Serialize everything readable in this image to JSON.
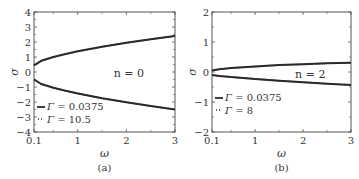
{
  "chart_data": [
    {
      "type": "line",
      "panel": "(a)",
      "caption": "(a)",
      "xlabel": "ω",
      "ylabel": "σ",
      "xlim": [
        0.1,
        3
      ],
      "ylim": [
        -4,
        4
      ],
      "xticks": [
        "0.1",
        "1",
        "2",
        "3"
      ],
      "yticks": [
        "-4",
        "-3",
        "-2",
        "-1",
        "0",
        "1",
        "2",
        "3",
        "4"
      ],
      "annotation": "n = 0",
      "x": [
        0.1,
        0.25,
        0.5,
        0.75,
        1.0,
        1.5,
        2.0,
        2.5,
        3.0
      ],
      "series": [
        {
          "name": "Γ = 0.0375",
          "style": "solid",
          "branch": "upper",
          "values": [
            0.45,
            0.75,
            1.0,
            1.2,
            1.38,
            1.68,
            1.95,
            2.18,
            2.4
          ]
        },
        {
          "name": "Γ = 0.0375",
          "style": "solid",
          "branch": "lower",
          "values": [
            -0.5,
            -0.8,
            -1.05,
            -1.25,
            -1.43,
            -1.75,
            -2.02,
            -2.27,
            -2.5
          ]
        },
        {
          "name": "Γ = 10.5",
          "style": "dotted",
          "branch": "upper",
          "values": [
            0.45,
            0.75,
            1.0,
            1.2,
            1.38,
            1.68,
            1.95,
            2.18,
            2.4
          ]
        },
        {
          "name": "Γ = 10.5",
          "style": "dotted",
          "branch": "lower",
          "values": [
            -0.5,
            -0.8,
            -1.05,
            -1.25,
            -1.43,
            -1.75,
            -2.02,
            -2.27,
            -2.5
          ]
        }
      ],
      "legend": [
        {
          "marker": "—",
          "label": "Γ = 0.0375"
        },
        {
          "marker": "··",
          "label": "Γ = 10.5"
        }
      ],
      "legend_position": "lower left"
    },
    {
      "type": "line",
      "panel": "(b)",
      "caption": "(b)",
      "xlabel": "ω",
      "ylabel": "σ",
      "xlim": [
        0.1,
        3
      ],
      "ylim": [
        -2,
        2
      ],
      "xticks": [
        "0.1",
        "1",
        "2",
        "3"
      ],
      "yticks": [
        "-2",
        "-1",
        "0",
        "1",
        "2"
      ],
      "annotation": "n = 2",
      "x": [
        0.1,
        0.25,
        0.5,
        0.75,
        1.0,
        1.5,
        2.0,
        2.5,
        3.0
      ],
      "series": [
        {
          "name": "Γ = 0.0375",
          "style": "solid",
          "branch": "upper",
          "values": [
            0.05,
            0.09,
            0.13,
            0.16,
            0.18,
            0.23,
            0.26,
            0.29,
            0.31
          ]
        },
        {
          "name": "Γ = 0.0375",
          "style": "solid",
          "branch": "lower",
          "values": [
            -0.1,
            -0.13,
            -0.17,
            -0.2,
            -0.23,
            -0.29,
            -0.34,
            -0.39,
            -0.43
          ]
        },
        {
          "name": "Γ = 8",
          "style": "dotted",
          "branch": "upper",
          "values": [
            0.05,
            0.09,
            0.13,
            0.16,
            0.18,
            0.23,
            0.26,
            0.29,
            0.31
          ]
        },
        {
          "name": "Γ = 8",
          "style": "dotted",
          "branch": "lower",
          "values": [
            -0.1,
            -0.13,
            -0.17,
            -0.2,
            -0.23,
            -0.29,
            -0.34,
            -0.39,
            -0.43
          ]
        }
      ],
      "legend": [
        {
          "marker": "—",
          "label": "Γ = 0.0375"
        },
        {
          "marker": "··",
          "label": "Γ = 8"
        }
      ],
      "legend_position": "lower left"
    }
  ],
  "layout": {
    "panels": [
      {
        "x0": 34,
        "x1": 175,
        "y0": 12,
        "y1": 132,
        "minor_xticks": [
          0.5,
          1.5,
          2.5
        ],
        "minor_yticks": [
          -3.5,
          -2.5,
          -1.5,
          -0.5,
          0.5,
          1.5,
          2.5,
          3.5
        ]
      },
      {
        "x0": 212,
        "x1": 351,
        "y0": 12,
        "y1": 132,
        "minor_xticks": [
          0.5,
          1.5,
          2.5
        ],
        "minor_yticks": [
          -1.5,
          -0.5,
          0.5,
          1.5
        ]
      }
    ],
    "line_color": "#2a2a2a",
    "frame_color": "#555555"
  }
}
